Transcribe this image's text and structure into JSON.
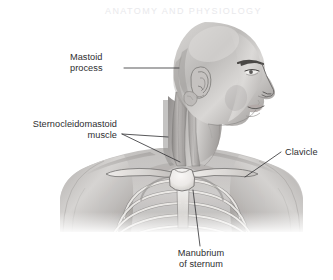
{
  "figure": {
    "background_color": "#ffffff",
    "style": "grayscale scanned textbook illustration",
    "ghost_header": "ANATOMY AND PHYSIOLOGY",
    "colors": {
      "background": "#ffffff",
      "skin_light": "#e6e5e4",
      "skin_mid": "#c9c7c6",
      "skin_shadow": "#9c9a99",
      "skin_deep_shadow": "#7a7877",
      "muscle": "#b7b4b2",
      "muscle_shadow": "#908d8c",
      "bone_light": "#f2f1ef",
      "bone_mid": "#d7d4d1",
      "bone_outline": "#6f6d6c",
      "label_text": "#2e2e30",
      "leader_line": "#3a3a3c"
    }
  },
  "labels": [
    {
      "id": "mastoid-process",
      "line1": "Mastoid",
      "line2": "process",
      "align": "left",
      "text_x": 70,
      "text_y_line1": 60,
      "text_y_line2": 71,
      "leader_from_x": 124,
      "leader_from_y": 68,
      "leader_to_x": 179,
      "leader_to_y": 68
    },
    {
      "id": "sternocleidomastoid-muscle",
      "line1": "Sternocleidomastoid",
      "line2": "muscle",
      "align": "right",
      "text_x": 117,
      "text_y_line1": 127,
      "text_y_line2": 138,
      "leader_fork_x": 122,
      "leader_fork_y": 134,
      "leader_a_to_x": 168,
      "leader_a_to_y": 137,
      "leader_b_to_x": 180,
      "leader_b_to_y": 162
    },
    {
      "id": "clavicle",
      "line1": "Clavicle",
      "line2": "",
      "align": "left",
      "text_x": 285,
      "text_y_line1": 155,
      "leader_from_x": 281,
      "leader_from_y": 152,
      "leader_to_x": 245,
      "leader_to_y": 177
    },
    {
      "id": "manubrium-of-sternum",
      "line1": "Manubrium",
      "line2": "of sternum",
      "align": "center",
      "text_x": 201,
      "text_y_line1": 256,
      "text_y_line2": 267,
      "leader_from_x": 200,
      "leader_from_y": 246,
      "leader_to_x": 193,
      "leader_to_y": 190
    }
  ]
}
